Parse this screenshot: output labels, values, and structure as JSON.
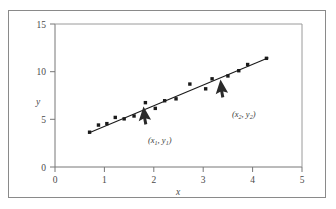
{
  "figure": {
    "background_color": "#ffffff",
    "frame_color": "#8a8a8a",
    "axis_color": "#777777",
    "marker_color": "#1a1a1a",
    "line_color": "#1a1a1a"
  },
  "chart_data": {
    "type": "scatter",
    "title": "",
    "xlabel": "x",
    "ylabel": "y",
    "xlim": [
      0,
      5
    ],
    "ylim": [
      0,
      15
    ],
    "xticks": [
      0,
      1,
      2,
      3,
      4,
      5
    ],
    "yticks": [
      0,
      5,
      10,
      15
    ],
    "xtick_labels": [
      "0",
      "1",
      "2",
      "3",
      "4",
      "5"
    ],
    "ytick_labels": [
      "0",
      "5",
      "10",
      "15"
    ],
    "grid": false,
    "legend": null,
    "series": [
      {
        "name": "observations",
        "type": "scatter",
        "marker": "square",
        "x": [
          0.7,
          0.88,
          1.05,
          1.22,
          1.4,
          1.6,
          1.83,
          2.03,
          2.22,
          2.45,
          2.73,
          3.05,
          3.18,
          3.5,
          3.72,
          3.9,
          4.28
        ],
        "y": [
          3.65,
          4.4,
          4.55,
          5.2,
          5.05,
          5.35,
          6.75,
          6.15,
          6.95,
          7.15,
          8.7,
          8.2,
          9.25,
          9.55,
          10.1,
          10.75,
          11.4
        ]
      },
      {
        "name": "fitted-line",
        "type": "line",
        "x": [
          0.67,
          4.32
        ],
        "y": [
          3.55,
          11.45
        ]
      }
    ],
    "annotations": [
      {
        "name": "point-1",
        "label": "(x₁, y₁)",
        "label_base": "(x",
        "sub1": "1",
        "mid": ", y",
        "sub2": "1",
        "close": ")",
        "arrow_tip_x": 1.83,
        "arrow_tip_y": 6.75,
        "label_x": 1.88,
        "label_y": 4.05
      },
      {
        "name": "point-2",
        "label": "(x₂, y₂)",
        "label_base": "(x",
        "sub1": "2",
        "mid": ", y",
        "sub2": "2",
        "close": ")",
        "arrow_tip_x": 3.28,
        "arrow_tip_y": 9.55,
        "label_x": 3.38,
        "label_y": 6.8
      }
    ]
  }
}
